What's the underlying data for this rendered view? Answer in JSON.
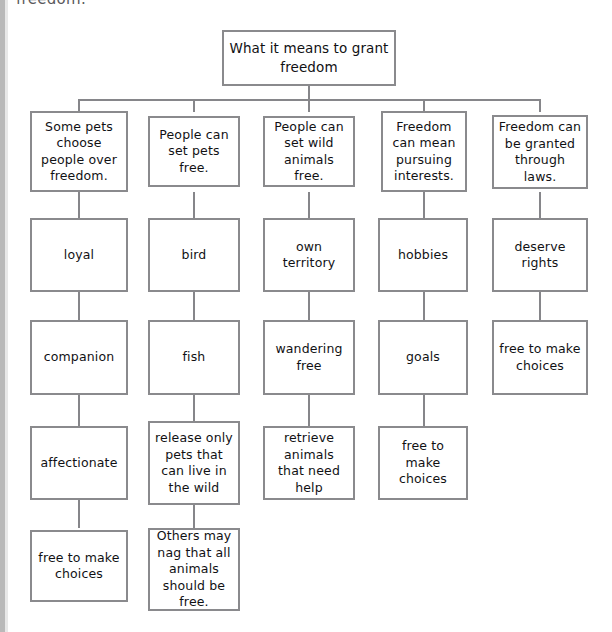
{
  "page": {
    "clipped_header_text": "freedom.",
    "box_border_color": "#8a8a8d",
    "text_color": "#111114",
    "background_color": "#ffffff"
  },
  "diagram": {
    "type": "tree-graphic-organizer",
    "root": {
      "id": "root",
      "label": "What it means to grant freedom"
    },
    "columns": [
      {
        "id": "col-1",
        "nodes": [
          {
            "id": "c1r1",
            "label": "Some pets choose people over freedom."
          },
          {
            "id": "c1r2",
            "label": "loyal"
          },
          {
            "id": "c1r3",
            "label": "companion"
          },
          {
            "id": "c1r4",
            "label": "affectionate"
          },
          {
            "id": "c1r5",
            "label": "free to make choices"
          }
        ]
      },
      {
        "id": "col-2",
        "nodes": [
          {
            "id": "c2r1",
            "label": "People can set pets free."
          },
          {
            "id": "c2r2",
            "label": "bird"
          },
          {
            "id": "c2r3",
            "label": "fish"
          },
          {
            "id": "c2r4",
            "label": "release only pets that can live in the wild"
          },
          {
            "id": "c2r5",
            "label": "Others may nag that all animals should be free."
          }
        ]
      },
      {
        "id": "col-3",
        "nodes": [
          {
            "id": "c3r1",
            "label": "People can set wild animals free."
          },
          {
            "id": "c3r2",
            "label": "own territory"
          },
          {
            "id": "c3r3",
            "label": "wandering free"
          },
          {
            "id": "c3r4",
            "label": "retrieve animals that need help"
          }
        ]
      },
      {
        "id": "col-4",
        "nodes": [
          {
            "id": "c4r1",
            "label": "Freedom can mean pursuing interests."
          },
          {
            "id": "c4r2",
            "label": "hobbies"
          },
          {
            "id": "c4r3",
            "label": "goals"
          },
          {
            "id": "c4r4",
            "label": "free to make choices"
          }
        ]
      },
      {
        "id": "col-5",
        "nodes": [
          {
            "id": "c5r1",
            "label": "Freedom can be granted through laws."
          },
          {
            "id": "c5r2",
            "label": "deserve rights"
          },
          {
            "id": "c5r3",
            "label": "free to make choices"
          }
        ]
      }
    ]
  }
}
